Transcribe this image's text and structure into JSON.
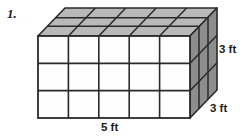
{
  "figure": {
    "problem_number": "1.",
    "shape": "rectangular-prism-unit-cubes",
    "faces": {
      "front": {
        "columns": 5,
        "rows": 3,
        "fill_color": "#fefefe"
      },
      "top": {
        "columns": 5,
        "rows": 3,
        "fill_color": "#b9b9b9"
      },
      "right": {
        "columns": 3,
        "rows": 3,
        "fill_color": "#8d8d8d"
      }
    },
    "stroke_color": "#2a2a2a",
    "labels": {
      "height": "3 ft",
      "depth": "3 ft",
      "width": "5 ft"
    }
  }
}
